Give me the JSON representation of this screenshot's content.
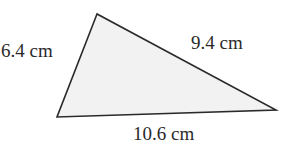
{
  "diagram": {
    "type": "triangle",
    "fill_color": "#f2f2f2",
    "stroke_color": "#2a2a2a",
    "vertices": {
      "top": [
        97,
        14
      ],
      "bottom_left": [
        57,
        117
      ],
      "right": [
        276,
        110
      ]
    },
    "sides": {
      "left": {
        "label": "6.4 cm",
        "length": 6.4,
        "unit": "cm"
      },
      "upper_right": {
        "label": "9.4 cm",
        "length": 9.4,
        "unit": "cm"
      },
      "bottom": {
        "label": "10.6 cm",
        "length": 10.6,
        "unit": "cm"
      }
    }
  }
}
